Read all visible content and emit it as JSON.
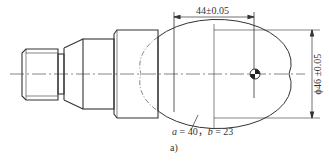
{
  "figure": {
    "caption": "a)",
    "dimensions": {
      "horizontal_length": "44±0.05",
      "diameter": "ϕ46 ±0.05"
    },
    "ellipse_parameters": {
      "a_label": "a",
      "a_value": "40",
      "separator": "，",
      "b_label": "b",
      "b_value": "23",
      "text": "a = 40， b = 23"
    },
    "colors": {
      "line": "#333333",
      "background": "#ffffff"
    }
  }
}
